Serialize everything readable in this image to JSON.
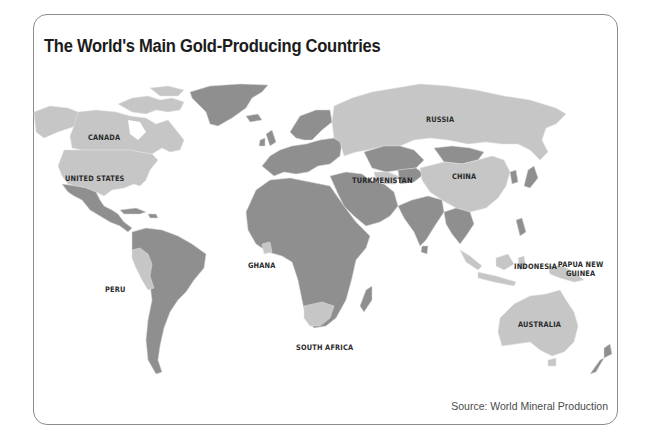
{
  "title": "The World's Main Gold-Producing Countries",
  "source": "Source: World Mineral Production",
  "colors": {
    "gold_producer": "#c6c6c6",
    "other_country": "#8f8f8f",
    "border": "#8c8c8c",
    "background": "#ffffff"
  },
  "labels": {
    "canada": "CANADA",
    "united_states": "UNITED STATES",
    "peru": "PERU",
    "ghana": "GHANA",
    "south_africa": "SOUTH AFRICA",
    "russia": "RUSSIA",
    "turkmenistan": "TURKMENISTAN",
    "china": "CHINA",
    "indonesia": "INDONESIA",
    "papua_new_guinea": "PAPUA NEW GUINEA",
    "australia": "AUSTRALIA"
  },
  "highlighted_countries": [
    "Canada",
    "United States",
    "Peru",
    "Ghana",
    "South Africa",
    "Russia",
    "Turkmenistan",
    "China",
    "Indonesia",
    "Papua New Guinea",
    "Australia"
  ]
}
